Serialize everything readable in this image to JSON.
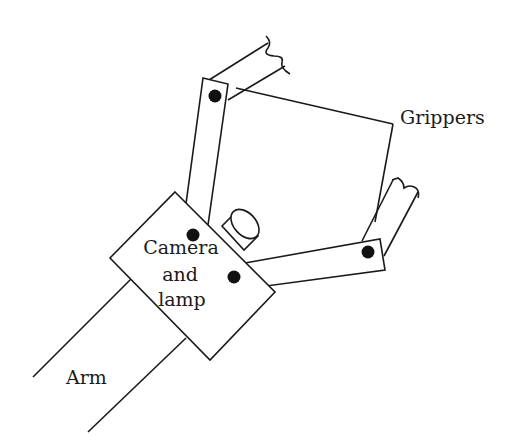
{
  "diagram": {
    "type": "labeled schematic",
    "labels": {
      "grippers": "Grippers",
      "camera_line1": "Camera",
      "camera_line2": "and",
      "camera_line3": "lamp",
      "arm": "Arm"
    },
    "components": [
      {
        "name": "arm",
        "description": "Two parallel lines entering the camera housing from lower left"
      },
      {
        "name": "camera-and-lamp-housing",
        "description": "Tilted rectangular housing"
      },
      {
        "name": "lamp-cylinder",
        "description": "Small cylinder protruding from housing"
      },
      {
        "name": "upper-gripper-link",
        "description": "Link from housing up to upper pivot, then gripper finger with broken end"
      },
      {
        "name": "lower-gripper-link",
        "description": "Link from housing to right pivot, then gripper finger with broken end"
      },
      {
        "name": "pivots",
        "count": 4
      }
    ],
    "colors": {
      "line": "#1a1a1a",
      "pivot": "#111111",
      "background": "#ffffff"
    }
  }
}
